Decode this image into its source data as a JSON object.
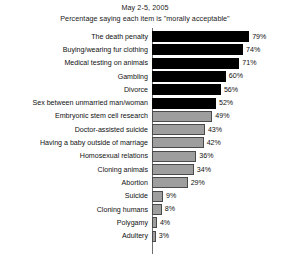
{
  "chart_data": {
    "type": "bar",
    "orientation": "horizontal",
    "title": "May 2-5, 2005",
    "subtitle": "Percentage saying each item is \"morally acceptable\"",
    "xlabel": "",
    "ylabel": "",
    "xlim": [
      0,
      100
    ],
    "grid": false,
    "legend": null,
    "value_suffix": "%",
    "categories": [
      "The death penalty",
      "Buying/wearing fur clothing",
      "Medical testing on animals",
      "Gambling",
      "Divorce",
      "Sex between unmarried man/woman",
      "Embryonic stem cell research",
      "Doctor-assisted suicide",
      "Having a baby outside of marriage",
      "Homosexual relations",
      "Cloning animals",
      "Abortion",
      "Suicide",
      "Cloning humans",
      "Polygamy",
      "Adultery"
    ],
    "values": [
      79,
      74,
      71,
      60,
      56,
      52,
      49,
      43,
      42,
      36,
      34,
      29,
      9,
      8,
      4,
      3
    ],
    "value_labels": [
      "79%",
      "74%",
      "71%",
      "60%",
      "56%",
      "52%",
      "49%",
      "43%",
      "42%",
      "36%",
      "34%",
      "29%",
      "9%",
      "8%",
      "4%",
      "3%"
    ],
    "bar_styles": [
      "dark",
      "dark",
      "dark",
      "dark",
      "dark",
      "dark",
      "light",
      "light",
      "light",
      "light",
      "light",
      "light",
      "light",
      "light",
      "light",
      "light"
    ],
    "colors": {
      "dark_bar": "#000000",
      "light_bar": "#9e9e9e",
      "light_bar_border": "#4a4a4a",
      "axis": "#6e6e6e",
      "text": "#111111",
      "background": "#ffffff"
    }
  }
}
